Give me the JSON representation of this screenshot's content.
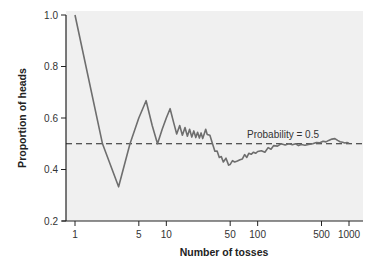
{
  "chart_data": {
    "type": "line",
    "title": "",
    "xlabel": "Number of tosses",
    "ylabel": "Proportion of heads",
    "xscale": "log",
    "xlim": [
      1,
      1000
    ],
    "ylim": [
      0.2,
      1.0
    ],
    "grid": false,
    "legend": "none",
    "xticks": [
      {
        "value": 1,
        "label": "1"
      },
      {
        "value": 5,
        "label": "5"
      },
      {
        "value": 10,
        "label": "10"
      },
      {
        "value": 50,
        "label": "50"
      },
      {
        "value": 100,
        "label": "100"
      },
      {
        "value": 500,
        "label": "500"
      },
      {
        "value": 1000,
        "label": "1000"
      }
    ],
    "yticks": [
      {
        "value": 0.2,
        "label": "0.2"
      },
      {
        "value": 0.4,
        "label": "0.4"
      },
      {
        "value": 0.6,
        "label": "0.6"
      },
      {
        "value": 0.8,
        "label": "0.8"
      },
      {
        "value": 1.0,
        "label": "1.0"
      }
    ],
    "reference_line": {
      "y": 0.5,
      "style": "dashed",
      "label": "Probability = 0.5"
    },
    "series": [
      {
        "name": "Proportion of heads",
        "color": "#6e6e6e",
        "x": [
          1,
          2,
          3,
          4,
          5,
          6,
          7,
          8,
          9,
          10,
          11,
          12,
          13,
          14,
          15,
          16,
          17,
          18,
          19,
          20,
          21,
          22,
          23,
          24,
          25,
          26,
          27,
          28,
          30,
          32,
          34,
          36,
          38,
          40,
          42,
          45,
          48,
          50,
          53,
          56,
          60,
          64,
          68,
          72,
          76,
          80,
          85,
          90,
          95,
          100,
          110,
          120,
          130,
          140,
          150,
          165,
          180,
          200,
          220,
          240,
          260,
          280,
          300,
          330,
          360,
          400,
          440,
          480,
          520,
          560,
          600,
          650,
          700,
          750,
          800,
          850,
          900,
          950,
          1000
        ],
        "y": [
          1.0,
          0.5,
          0.333,
          0.5,
          0.6,
          0.667,
          0.571,
          0.5,
          0.556,
          0.6,
          0.636,
          0.583,
          0.538,
          0.571,
          0.533,
          0.563,
          0.529,
          0.556,
          0.526,
          0.55,
          0.524,
          0.545,
          0.522,
          0.542,
          0.52,
          0.538,
          0.556,
          0.536,
          0.533,
          0.5,
          0.471,
          0.472,
          0.447,
          0.45,
          0.429,
          0.444,
          0.417,
          0.42,
          0.434,
          0.429,
          0.433,
          0.438,
          0.441,
          0.458,
          0.447,
          0.463,
          0.459,
          0.467,
          0.463,
          0.47,
          0.473,
          0.467,
          0.485,
          0.479,
          0.493,
          0.491,
          0.5,
          0.495,
          0.5,
          0.496,
          0.5,
          0.493,
          0.497,
          0.494,
          0.497,
          0.5,
          0.505,
          0.504,
          0.51,
          0.507,
          0.513,
          0.518,
          0.52,
          0.513,
          0.508,
          0.506,
          0.503,
          0.505,
          0.502
        ]
      }
    ]
  }
}
